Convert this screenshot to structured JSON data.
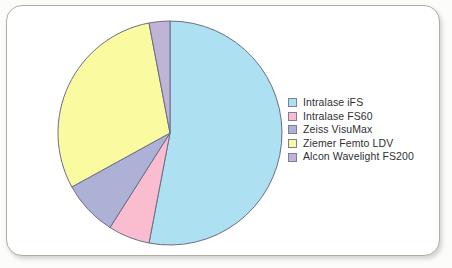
{
  "figure": {
    "background_color": "#ffffff",
    "frame_border_color": "#b3ada1"
  },
  "legend": {
    "position": "right",
    "items": [
      {
        "label": "Intralase iFS",
        "color": "#ade0f0"
      },
      {
        "label": "Intralase FS60",
        "color": "#fabdd0"
      },
      {
        "label": "Zeiss VisuMax",
        "color": "#adb1d6"
      },
      {
        "label": "Ziemer Femto LDV",
        "color": "#fafaa0"
      },
      {
        "label": "Alcon Wavelight FS200",
        "color": "#c0b4d6"
      }
    ]
  },
  "chart_data": {
    "type": "pie",
    "title": "",
    "subtitle": "",
    "xlabel": "",
    "ylabel": "",
    "grid": false,
    "legend_position": "right",
    "start_angle_deg": 0,
    "direction": "clockwise",
    "categories": [
      "Intralase iFS",
      "Intralase FS60",
      "Zeiss VisuMax",
      "Ziemer Femto LDV",
      "Alcon Wavelight FS200"
    ],
    "values": [
      53,
      6,
      8,
      30,
      3
    ],
    "units": "percent",
    "colors": [
      "#ade0f0",
      "#fabdd0",
      "#adb1d6",
      "#fafaa0",
      "#c0b4d6"
    ],
    "slices": [
      {
        "label": "Intralase iFS",
        "value": 53,
        "start_deg": 0,
        "end_deg": 190.8,
        "color": "#ade0f0"
      },
      {
        "label": "Intralase FS60",
        "value": 6,
        "start_deg": 190.8,
        "end_deg": 212.4,
        "color": "#fabdd0"
      },
      {
        "label": "Zeiss VisuMax",
        "value": 8,
        "start_deg": 212.4,
        "end_deg": 241.2,
        "color": "#adb1d6"
      },
      {
        "label": "Ziemer Femto LDV",
        "value": 30,
        "start_deg": 241.2,
        "end_deg": 349.2,
        "color": "#fafaa0"
      },
      {
        "label": "Alcon Wavelight FS200",
        "value": 3,
        "start_deg": 349.2,
        "end_deg": 360,
        "color": "#c0b4d6"
      }
    ],
    "slice_outline_color": "#6b6d87"
  }
}
